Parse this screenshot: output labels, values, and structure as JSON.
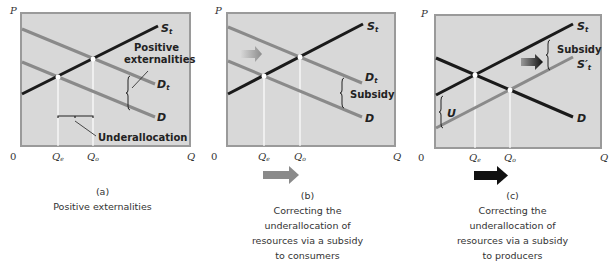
{
  "colors": {
    "plot_bg": "#d8d8d8",
    "plot_border": "#9a9a9a",
    "black_curve": "#1a1a1a",
    "gray_curve": "#8a8a8a",
    "guide_line": "#ffffff"
  },
  "panels": [
    {
      "id": "a",
      "axis": {
        "y": "P",
        "x": "Q",
        "origin": "0"
      },
      "ticks": {
        "qe": "Q",
        "qe_sub": "e",
        "qo": "Q",
        "qo_sub": "o"
      },
      "curves": {
        "supply": "S",
        "supply_sub": "t",
        "demand_t": "D",
        "demand_t_sub": "t",
        "demand": "D"
      },
      "annotations": {
        "externalities_line1": "Positive",
        "externalities_line2": "externalities",
        "underallocation": "Underallocation"
      },
      "caption": {
        "letter": "(a)",
        "lines": [
          "Positive externalities"
        ]
      }
    },
    {
      "id": "b",
      "axis": {
        "y": "P",
        "x": "Q",
        "origin": "0"
      },
      "ticks": {
        "qe": "Q",
        "qe_sub": "e",
        "qo": "Q",
        "qo_sub": "o"
      },
      "curves": {
        "supply": "S",
        "supply_sub": "t",
        "demand_t": "D",
        "demand_t_sub": "t",
        "demand": "D"
      },
      "annotations": {
        "subsidy": "Subsidy"
      },
      "caption": {
        "letter": "(b)",
        "lines": [
          "Correcting the",
          "underallocation of",
          "resources via a subsidy",
          "to consumers"
        ]
      }
    },
    {
      "id": "c",
      "axis": {
        "y": "P",
        "x": "Q",
        "origin": "0"
      },
      "ticks": {
        "qe": "Q",
        "qe_sub": "e",
        "qo": "Q",
        "qo_sub": "o"
      },
      "curves": {
        "supply": "S",
        "supply_sub": "t",
        "supply_prime": "S′",
        "supply_prime_sub": "t",
        "demand": "D"
      },
      "annotations": {
        "subsidy": "Subsidy",
        "u": "U"
      },
      "caption": {
        "letter": "(c)",
        "lines": [
          "Correcting the",
          "underallocation of",
          "resources via a subsidy",
          "to producers"
        ]
      }
    }
  ]
}
